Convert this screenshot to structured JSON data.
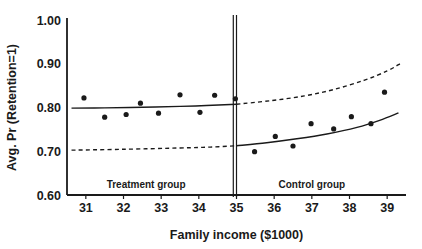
{
  "chart_data": {
    "type": "scatter",
    "title": "",
    "xlabel": "Family income ($1000)",
    "ylabel": "Avg. Pr (Retention=1)",
    "xlim": [
      30.5,
      39.5
    ],
    "ylim": [
      0.6,
      1.0
    ],
    "xticks": [
      31,
      32,
      33,
      34,
      35,
      36,
      37,
      38,
      39
    ],
    "xtick_labels": [
      "31",
      "32",
      "33",
      "34",
      "35",
      "36",
      "37",
      "38",
      "39"
    ],
    "yticks": [
      0.6,
      0.7,
      0.8,
      0.9,
      1.0
    ],
    "ytick_labels": [
      "0.60",
      "0.70",
      "0.80",
      "0.90",
      "1.00"
    ],
    "grid": false,
    "legend_position": "none",
    "cutoff": 35,
    "annotations": [
      {
        "name": "treatment-group-label",
        "text": "Treatment group",
        "x": 32.6,
        "y": 0.617
      },
      {
        "name": "control-group-label",
        "text": "Control group",
        "x": 37.0,
        "y": 0.617
      }
    ],
    "series": [
      {
        "name": "Treatment group observed means",
        "type": "scatter",
        "marker": "filled-circle",
        "color": "#1a1a1a",
        "points": [
          {
            "x": 30.95,
            "y": 0.822
          },
          {
            "x": 31.5,
            "y": 0.778
          },
          {
            "x": 32.07,
            "y": 0.784
          },
          {
            "x": 32.45,
            "y": 0.81
          },
          {
            "x": 32.93,
            "y": 0.787
          },
          {
            "x": 33.5,
            "y": 0.829
          },
          {
            "x": 34.03,
            "y": 0.789
          },
          {
            "x": 34.42,
            "y": 0.828
          },
          {
            "x": 34.97,
            "y": 0.82
          }
        ]
      },
      {
        "name": "Control group observed means",
        "type": "scatter",
        "marker": "filled-circle",
        "color": "#1a1a1a",
        "points": [
          {
            "x": 35.48,
            "y": 0.699
          },
          {
            "x": 36.03,
            "y": 0.734
          },
          {
            "x": 36.5,
            "y": 0.712
          },
          {
            "x": 36.98,
            "y": 0.763
          },
          {
            "x": 37.58,
            "y": 0.751
          },
          {
            "x": 38.05,
            "y": 0.779
          },
          {
            "x": 38.57,
            "y": 0.763
          },
          {
            "x": 38.93,
            "y": 0.835
          }
        ]
      },
      {
        "name": "Treatment group fitted line",
        "type": "line",
        "style": "solid",
        "color": "#1a1a1a",
        "points": [
          {
            "x": 30.62,
            "y": 0.7985
          },
          {
            "x": 31.5,
            "y": 0.7992
          },
          {
            "x": 32.5,
            "y": 0.8005
          },
          {
            "x": 33.5,
            "y": 0.8025
          },
          {
            "x": 34.2,
            "y": 0.8045
          },
          {
            "x": 35.0,
            "y": 0.8075
          }
        ]
      },
      {
        "name": "Control group fitted line",
        "type": "line",
        "style": "solid",
        "color": "#1a1a1a",
        "points": [
          {
            "x": 35.0,
            "y": 0.7125
          },
          {
            "x": 35.8,
            "y": 0.7195
          },
          {
            "x": 36.6,
            "y": 0.7285
          },
          {
            "x": 37.4,
            "y": 0.7395
          },
          {
            "x": 38.2,
            "y": 0.7545
          },
          {
            "x": 38.8,
            "y": 0.7705
          },
          {
            "x": 39.3,
            "y": 0.7875
          }
        ]
      },
      {
        "name": "Counterfactual for treatment group",
        "type": "line",
        "style": "dashed",
        "color": "#1a1a1a",
        "points": [
          {
            "x": 30.62,
            "y": 0.7025
          },
          {
            "x": 32.0,
            "y": 0.7045
          },
          {
            "x": 33.5,
            "y": 0.7075
          },
          {
            "x": 34.3,
            "y": 0.7095
          },
          {
            "x": 35.0,
            "y": 0.7125
          }
        ]
      },
      {
        "name": "Counterfactual for control group",
        "type": "line",
        "style": "dashed",
        "color": "#1a1a1a",
        "points": [
          {
            "x": 35.0,
            "y": 0.8075
          },
          {
            "x": 35.9,
            "y": 0.8155
          },
          {
            "x": 36.8,
            "y": 0.8265
          },
          {
            "x": 37.6,
            "y": 0.8415
          },
          {
            "x": 38.4,
            "y": 0.8625
          },
          {
            "x": 39.0,
            "y": 0.8835
          },
          {
            "x": 39.35,
            "y": 0.9005
          }
        ]
      }
    ]
  }
}
